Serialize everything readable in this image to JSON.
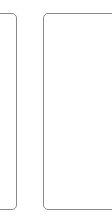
{
  "panels": [
    {
      "id": "left",
      "label": "",
      "border_color": "#8a8a8a"
    },
    {
      "id": "right",
      "label": "",
      "border_color": "#8a8a8a"
    }
  ],
  "colors": {
    "background": "#ffffff",
    "border": "#8a8a8a"
  }
}
